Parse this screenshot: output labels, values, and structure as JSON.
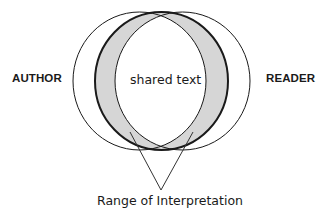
{
  "diagram": {
    "type": "venn-interpretation",
    "labels": {
      "left": "AUTHOR",
      "right": "READER",
      "center": "shared text",
      "bottom": "Range of Interpretation"
    },
    "colors": {
      "stroke": "#1a1a1a",
      "range_fill": "#d6d6d6",
      "background": "#ffffff"
    },
    "shapes": {
      "author_circle": {
        "cx": 139.5,
        "cy": 81,
        "rx": 66.5,
        "ry": 69
      },
      "reader_circle": {
        "cx": 182.5,
        "cy": 81,
        "rx": 67.5,
        "ry": 69
      },
      "text_ellipse": {
        "cx": 161.5,
        "cy": 81,
        "rx": 66.5,
        "ry": 69
      }
    },
    "pointer": {
      "apex": [
        161,
        190
      ],
      "left_end": [
        130,
        132
      ],
      "right_end": [
        193,
        132
      ]
    }
  }
}
